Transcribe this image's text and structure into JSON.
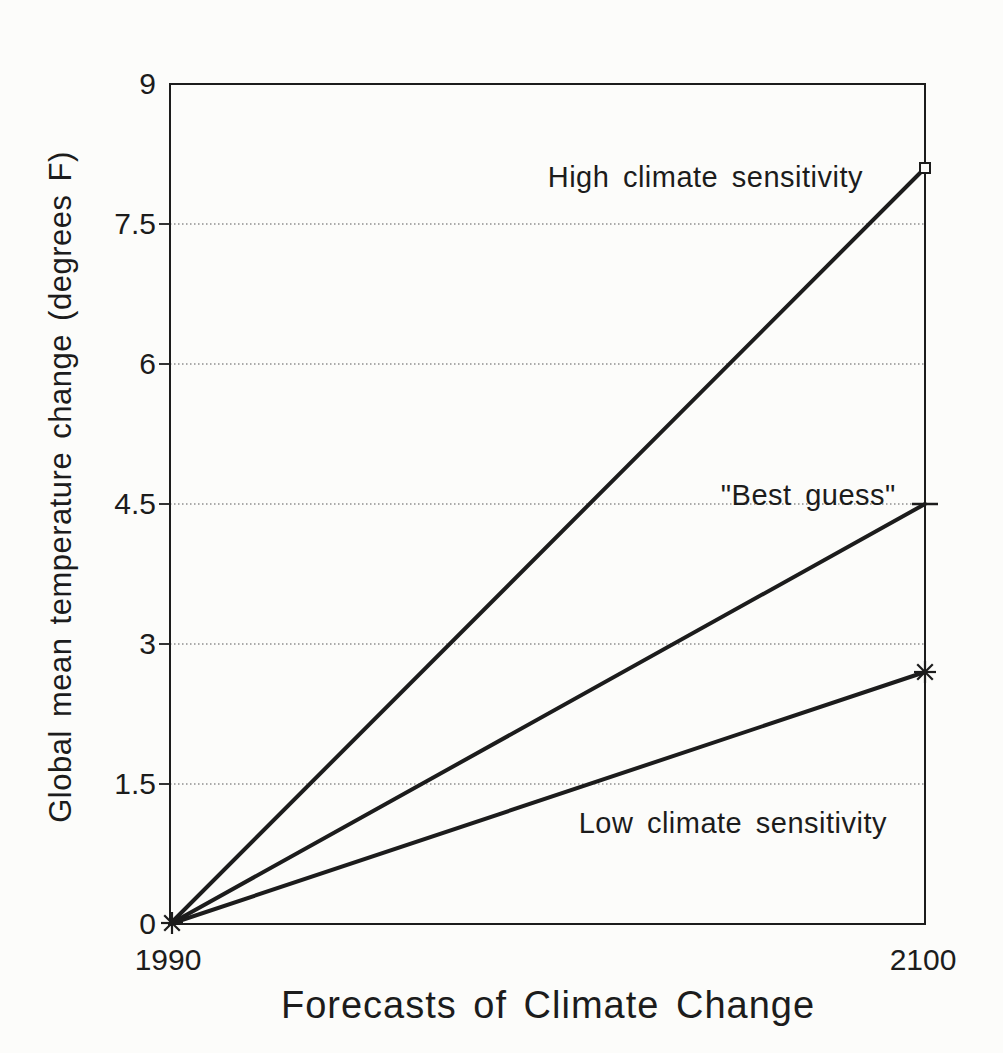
{
  "figure": {
    "background": "#fcfcfa",
    "ink_color": "#1c1c1c",
    "grid_color": "#8e8e8e"
  },
  "chart_data": {
    "type": "line",
    "title": "",
    "xlabel": "Forecasts of Climate Change",
    "ylabel": "Global mean temperature change (degrees F)",
    "xlim": [
      1990,
      2100
    ],
    "ylim": [
      0,
      9
    ],
    "x": [
      1990,
      2100
    ],
    "xticks": {
      "values": [
        1990,
        2100
      ],
      "labels": [
        "1990",
        "2100"
      ]
    },
    "yticks": {
      "values": [
        0,
        1.5,
        3,
        4.5,
        6,
        7.5,
        9
      ],
      "labels": [
        "0",
        "1.5",
        "3",
        "4.5",
        "6",
        "7.5",
        "9"
      ]
    },
    "grid": {
      "horizontal": true,
      "values": [
        1.5,
        3,
        4.5,
        6,
        7.5
      ],
      "style": "dotted"
    },
    "legend": "inline-labels",
    "start_marker": "asterisk",
    "series": [
      {
        "name": "High climate sensitivity",
        "values": [
          0,
          8.1
        ],
        "end_marker": "square",
        "label": {
          "text": "High climate sensitivity",
          "x": 2068,
          "y": 8.0
        }
      },
      {
        "name": "\"Best guess\"",
        "values": [
          0,
          4.5
        ],
        "end_marker": "dash",
        "label": {
          "text": "\"Best guess\"",
          "x": 2083,
          "y": 4.6
        }
      },
      {
        "name": "Low climate sensitivity",
        "values": [
          0,
          2.7
        ],
        "end_marker": "asterisk",
        "label": {
          "text": "Low climate sensitivity",
          "x": 2072,
          "y": 1.08
        }
      }
    ]
  }
}
